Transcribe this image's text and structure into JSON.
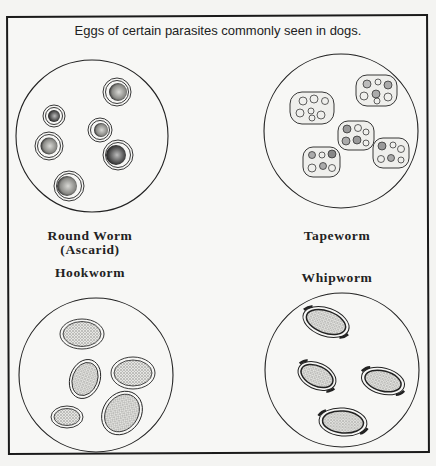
{
  "title": "Eggs of certain parasites commonly seen in dogs.",
  "labels": {
    "roundworm": "Round Worm",
    "roundworm_sub": "(Ascarid)",
    "tapeworm": "Tapeworm",
    "hookworm": "Hookworm",
    "whipworm": "Whipworm"
  },
  "panels": [
    {
      "name": "Round Worm (Ascarid)",
      "position": "top-left",
      "egg_count": 6
    },
    {
      "name": "Tapeworm",
      "position": "top-right",
      "egg_count": 5
    },
    {
      "name": "Hookworm",
      "position": "bottom-left",
      "egg_count": 5
    },
    {
      "name": "Whipworm",
      "position": "bottom-right",
      "egg_count": 4
    }
  ],
  "colors": {
    "ink": "#1a1a1a",
    "paper": "#f7f7f5"
  }
}
